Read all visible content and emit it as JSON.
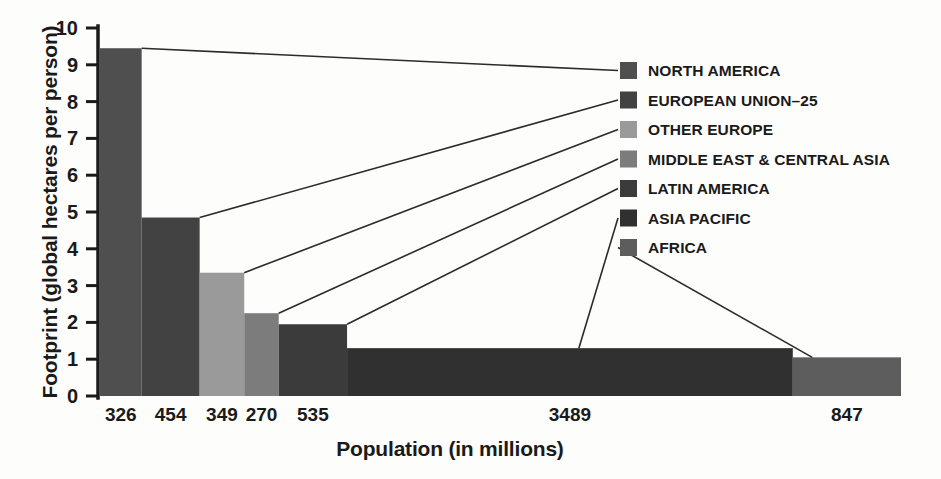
{
  "chart_data": {
    "type": "bar",
    "title": "",
    "subtitle": "",
    "xlabel": "Population (in millions)",
    "ylabel": "Footprint (global hectares per person)",
    "ylim": [
      0,
      10
    ],
    "xlim": [
      0,
      6270
    ],
    "grid": false,
    "legend_position": "right",
    "y_ticks": [
      "0",
      "1",
      "2",
      "3",
      "4",
      "5",
      "6",
      "7",
      "8",
      "9",
      "10"
    ],
    "categories": [
      "NORTH AMERICA",
      "EUROPEAN UNION–25",
      "OTHER EUROPE",
      "MIDDLE EAST & CENTRAL ASIA",
      "LATIN AMERICA",
      "ASIA PACIFIC",
      "AFRICA"
    ],
    "x_tick_labels": [
      "326",
      "454",
      "349",
      "270",
      "535",
      "3489",
      "847"
    ],
    "populations": [
      326,
      454,
      349,
      270,
      535,
      3489,
      847
    ],
    "values": [
      9.45,
      4.85,
      3.35,
      2.25,
      1.95,
      1.3,
      1.05
    ],
    "colors": [
      "#4f4f4f",
      "#424242",
      "#9a9a9a",
      "#7c7c7c",
      "#3b3b3b",
      "#303030",
      "#5d5d5d"
    ],
    "series": [
      {
        "name": "Footprint (global hectares per person)",
        "values": [
          9.45,
          4.85,
          3.35,
          2.25,
          1.95,
          1.3,
          1.05
        ]
      }
    ]
  },
  "legend": {
    "items": [
      {
        "label": "NORTH AMERICA",
        "color": "#4f4f4f"
      },
      {
        "label": "EUROPEAN UNION–25",
        "color": "#424242"
      },
      {
        "label": "OTHER EUROPE",
        "color": "#9a9a9a"
      },
      {
        "label": "MIDDLE EAST & CENTRAL ASIA",
        "color": "#7c7c7c"
      },
      {
        "label": "LATIN AMERICA",
        "color": "#3b3b3b"
      },
      {
        "label": "ASIA PACIFIC",
        "color": "#303030"
      },
      {
        "label": "AFRICA",
        "color": "#5d5d5d"
      }
    ]
  },
  "axes": {
    "y_title": "Footprint (global hectares per person)",
    "x_title": "Population (in millions)",
    "y_ticks": [
      "10",
      "9",
      "8",
      "7",
      "6",
      "5",
      "4",
      "3",
      "2",
      "1",
      "0"
    ],
    "x_labels": [
      "326",
      "454",
      "349",
      "270",
      "535",
      "3489",
      "847"
    ]
  }
}
